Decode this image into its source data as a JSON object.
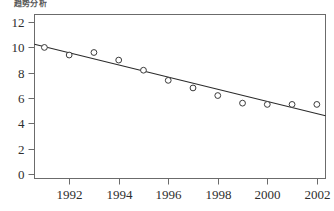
{
  "chart_data": {
    "type": "scatter",
    "title": "趋势分析",
    "subtitle": "",
    "xlabel": "",
    "ylabel": "",
    "x": [
      1991,
      1992,
      1993,
      1994,
      1995,
      1996,
      1997,
      1998,
      1999,
      2000,
      2001,
      2002
    ],
    "values": [
      10.0,
      9.4,
      9.6,
      9.0,
      8.2,
      7.4,
      6.8,
      6.2,
      5.6,
      5.5,
      5.5,
      5.5
    ],
    "series": [
      {
        "name": "data-points",
        "type": "scatter",
        "marker": "open-circle",
        "values": [
          10.0,
          9.4,
          9.6,
          9.0,
          8.2,
          7.4,
          6.8,
          6.2,
          5.6,
          5.5,
          5.5,
          5.5
        ]
      },
      {
        "name": "trend-line",
        "type": "line",
        "endpoints": [
          {
            "x": 1990.6,
            "y": 10.25
          },
          {
            "x": 2002.35,
            "y": 4.6
          }
        ]
      }
    ],
    "xlim": [
      1990.6,
      2002.35
    ],
    "ylim": [
      -0.35,
      12.6
    ],
    "xticks": [
      1992,
      1994,
      1996,
      1998,
      2000,
      2002
    ],
    "xtick_labels": [
      "1992",
      "1994",
      "1996",
      "1998",
      "2000",
      "2002"
    ],
    "yticks": [
      0,
      2,
      4,
      6,
      8,
      10,
      12
    ],
    "ytick_labels": [
      "0",
      "2",
      "4",
      "6",
      "8",
      "10",
      "12"
    ],
    "grid": false,
    "legend": null,
    "legend_position": "none",
    "annotations": []
  },
  "style": {
    "background": "#ffffff",
    "axis_color": "#6b6b6b",
    "marker_edge_color": "#3a3a3a",
    "marker_face_color": "#ffffff",
    "line_color": "#2b2b2b",
    "tick_label_color": "#2e2e2e"
  }
}
